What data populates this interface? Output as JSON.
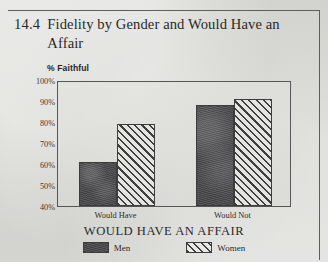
{
  "figure": {
    "number": "14.4",
    "title": "Fidelity by Gender and Would Have an Affair"
  },
  "chart_data": {
    "type": "bar",
    "title": "Fidelity by Gender and Would Have an Affair",
    "xlabel": "WOULD HAVE AN AFFAIR",
    "ylabel": "% Faithful",
    "categories": [
      "Would Have",
      "Would Not"
    ],
    "series": [
      {
        "name": "Men",
        "values": [
          61,
          88
        ],
        "fill": "solid-dark",
        "color": "#4f4f52"
      },
      {
        "name": "Women",
        "values": [
          79,
          91
        ],
        "fill": "diagonal-hatch",
        "color": "#3f3f42"
      }
    ],
    "ylim": [
      40,
      100
    ],
    "ytick_labels": [
      "100%",
      "90%",
      "80%",
      "70%",
      "60%",
      "50%",
      "40%"
    ],
    "ytick_values": [
      100,
      90,
      80,
      70,
      60,
      50,
      40
    ],
    "grid": false,
    "legend_position": "bottom"
  },
  "legend": {
    "items": [
      {
        "label": "Men"
      },
      {
        "label": "Women"
      }
    ]
  }
}
